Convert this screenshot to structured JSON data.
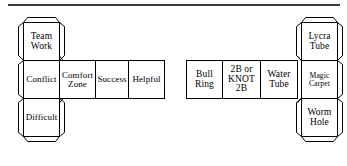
{
  "figure": {
    "kind": "cube-net-diagram",
    "line_color": "#000000",
    "background_color": "#ffffff",
    "rule_color": "#3a3a3a"
  },
  "left_net": {
    "name": "teamwork-cube-net",
    "column_faces": [
      {
        "id": "team-work",
        "text": "Team\nWork"
      },
      {
        "id": "conflict",
        "text": "Conflict"
      },
      {
        "id": "difficult",
        "text": "Difficult"
      }
    ],
    "row_faces": [
      {
        "id": "comfort-zone",
        "text": "Comfort\nZone"
      },
      {
        "id": "success",
        "text": "Success"
      },
      {
        "id": "helpful",
        "text": "Helpful"
      }
    ]
  },
  "right_net": {
    "name": "activities-cube-net",
    "row_faces": [
      {
        "id": "bull-ring",
        "text": "Bull\nRing"
      },
      {
        "id": "2b-or-knot-2b",
        "text": "2B or\nKNOT\n2B"
      },
      {
        "id": "water-tube",
        "text": "Water\nTube"
      }
    ],
    "column_faces": [
      {
        "id": "lycra-tube",
        "text": "Lycra\nTube"
      },
      {
        "id": "magic-carpet",
        "text": "Magic\nCarpet"
      },
      {
        "id": "worm-hole",
        "text": "Worm\nHole"
      }
    ]
  }
}
